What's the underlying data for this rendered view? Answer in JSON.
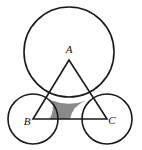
{
  "figure": {
    "kind": "geometry-diagram",
    "background_color": "#ffffff",
    "stroke_color": "#1a1a1a",
    "shade_color": "#8a8a8a",
    "label_color": "#111111",
    "stroke_width": 1.6,
    "canvas": {
      "width": 142,
      "height": 150
    }
  },
  "circles": [
    {
      "id": "circle-a",
      "name": "large-circle-at-A",
      "center_label": "A",
      "cx": 69,
      "cy": 52,
      "r": 45
    },
    {
      "id": "circle-b",
      "name": "small-circle-at-B",
      "center_label": "B",
      "cx": 33,
      "cy": 119,
      "r": 25
    },
    {
      "id": "circle-c",
      "name": "small-circle-at-C",
      "center_label": "C",
      "cx": 107,
      "cy": 119,
      "r": 25
    }
  ],
  "triangle": {
    "name": "triangle-ABC",
    "vertices": [
      {
        "label": "A",
        "x": 69,
        "y": 60
      },
      {
        "label": "B",
        "x": 33,
        "y": 119
      },
      {
        "label": "C",
        "x": 107,
        "y": 119
      }
    ],
    "points_attr": "69,60 33,119 107,119"
  },
  "labels": [
    {
      "id": "label-a",
      "text": "A",
      "x": 69,
      "y": 50
    },
    {
      "id": "label-b",
      "text": "B",
      "x": 27,
      "y": 122
    },
    {
      "id": "label-c",
      "text": "C",
      "x": 112,
      "y": 121
    }
  ],
  "shaded_region": {
    "name": "curvilinear-triangle-shaded",
    "fill": "#8a8a8a",
    "path": "M 52.2 100.4 A 45 45 0 0 0 86.0 100.4 A 25 25 0 0 0 70.0 119.0 L 49.5 119.0 A 25 25 0 0 0 52.2 100.4 Z"
  }
}
